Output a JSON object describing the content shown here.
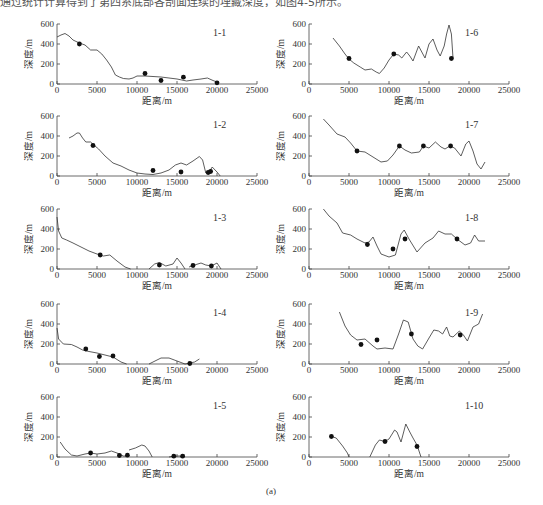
{
  "header": {
    "clipped_text": "通过统计计算得到了第四系底部各剖面连续的埋藏深度，如图4-5所示。"
  },
  "caption": "(a)",
  "axes": {
    "xlabel": "距离/m",
    "ylabel": "深度/m",
    "xticks": [
      0,
      5000,
      10000,
      15000,
      20000,
      25000
    ],
    "yticks": [
      0,
      200,
      400,
      600
    ],
    "xlim": [
      0,
      25000
    ],
    "ylim": [
      0,
      600
    ]
  },
  "chart_data": [
    {
      "type": "line",
      "title": "1-1",
      "line": [
        [
          0,
          470
        ],
        [
          500,
          490
        ],
        [
          1000,
          505
        ],
        [
          1500,
          480
        ],
        [
          2000,
          440
        ],
        [
          2800,
          410
        ],
        [
          3500,
          390
        ],
        [
          4200,
          340
        ],
        [
          5000,
          340
        ],
        [
          5600,
          300
        ],
        [
          6200,
          240
        ],
        [
          6800,
          170
        ],
        [
          7300,
          90
        ],
        [
          7800,
          70
        ],
        [
          8300,
          55
        ],
        [
          9000,
          50
        ],
        [
          9500,
          60
        ],
        [
          10000,
          80
        ],
        [
          11000,
          80
        ],
        [
          12000,
          75
        ],
        [
          13000,
          70
        ],
        [
          14000,
          60
        ],
        [
          15000,
          50
        ],
        [
          15600,
          40
        ],
        [
          16200,
          30
        ],
        [
          17000,
          40
        ],
        [
          18000,
          50
        ],
        [
          18800,
          60
        ],
        [
          19500,
          35
        ],
        [
          20000,
          20
        ]
      ],
      "points": [
        [
          2800,
          400
        ],
        [
          11000,
          105
        ],
        [
          13000,
          35
        ],
        [
          15800,
          68
        ],
        [
          20000,
          12
        ]
      ],
      "xlim": [
        0,
        25000
      ],
      "ylim": [
        0,
        600
      ]
    },
    {
      "type": "line",
      "title": "1-2",
      "line": [
        [
          1500,
          380
        ],
        [
          2000,
          400
        ],
        [
          2500,
          430
        ],
        [
          2800,
          430
        ],
        [
          3200,
          380
        ],
        [
          3600,
          340
        ],
        [
          4200,
          340
        ],
        [
          4600,
          310
        ],
        [
          5200,
          270
        ],
        [
          6000,
          200
        ],
        [
          7000,
          130
        ],
        [
          8000,
          100
        ],
        [
          9000,
          60
        ],
        [
          10000,
          30
        ],
        [
          11000,
          20
        ],
        [
          12000,
          15
        ],
        [
          13000,
          30
        ],
        [
          14000,
          60
        ],
        [
          14800,
          110
        ],
        [
          15500,
          130
        ],
        [
          16200,
          110
        ],
        [
          17000,
          150
        ],
        [
          17800,
          195
        ],
        [
          18200,
          160
        ],
        [
          18600,
          30
        ],
        [
          18900,
          20
        ],
        [
          19400,
          90
        ],
        [
          20000,
          40
        ],
        [
          20400,
          0
        ]
      ],
      "points": [
        [
          4500,
          305
        ],
        [
          12000,
          55
        ],
        [
          15500,
          40
        ],
        [
          18900,
          35
        ],
        [
          19200,
          45
        ]
      ],
      "xlim": [
        0,
        25000
      ],
      "ylim": [
        0,
        600
      ]
    },
    {
      "type": "line",
      "title": "1-3",
      "line": [
        [
          0,
          520
        ],
        [
          200,
          380
        ],
        [
          600,
          310
        ],
        [
          1200,
          290
        ],
        [
          2000,
          260
        ],
        [
          3000,
          220
        ],
        [
          4000,
          180
        ],
        [
          5000,
          150
        ],
        [
          5800,
          130
        ],
        [
          6600,
          140
        ],
        [
          7500,
          80
        ],
        [
          8500,
          20
        ],
        [
          9200,
          0
        ]
      ],
      "line2": [
        [
          11500,
          0
        ],
        [
          12200,
          50
        ],
        [
          12800,
          65
        ],
        [
          13600,
          30
        ],
        [
          14500,
          50
        ],
        [
          15000,
          110
        ],
        [
          15500,
          60
        ],
        [
          16000,
          0
        ]
      ],
      "line3": [
        [
          16500,
          20
        ],
        [
          17200,
          40
        ],
        [
          18000,
          60
        ],
        [
          18600,
          40
        ],
        [
          19300,
          30
        ],
        [
          20000,
          60
        ],
        [
          20500,
          0
        ]
      ],
      "points": [
        [
          5400,
          140
        ],
        [
          12800,
          40
        ],
        [
          17000,
          35
        ],
        [
          19300,
          30
        ]
      ],
      "xlim": [
        0,
        25000
      ],
      "ylim": [
        0,
        600
      ]
    },
    {
      "type": "line",
      "title": "1-4",
      "line": [
        [
          0,
          360
        ],
        [
          200,
          250
        ],
        [
          800,
          200
        ],
        [
          1800,
          195
        ],
        [
          2500,
          170
        ],
        [
          3200,
          140
        ],
        [
          4000,
          125
        ],
        [
          5000,
          110
        ],
        [
          6000,
          90
        ],
        [
          7000,
          70
        ],
        [
          8000,
          20
        ],
        [
          8700,
          0
        ]
      ],
      "line2": [
        [
          11500,
          0
        ],
        [
          12500,
          40
        ],
        [
          13000,
          60
        ],
        [
          14000,
          60
        ],
        [
          15000,
          30
        ],
        [
          16000,
          0
        ],
        [
          16600,
          10
        ],
        [
          17200,
          20
        ],
        [
          17800,
          50
        ]
      ],
      "points": [
        [
          3600,
          150
        ],
        [
          5300,
          75
        ],
        [
          7000,
          80
        ],
        [
          16600,
          5
        ]
      ],
      "xlim": [
        0,
        25000
      ],
      "ylim": [
        0,
        600
      ]
    },
    {
      "type": "line",
      "title": "1-5",
      "line": [
        [
          400,
          150
        ],
        [
          1000,
          80
        ],
        [
          1800,
          20
        ],
        [
          2500,
          10
        ],
        [
          3500,
          30
        ],
        [
          4200,
          40
        ],
        [
          5000,
          30
        ],
        [
          6000,
          40
        ],
        [
          6800,
          60
        ],
        [
          7500,
          40
        ],
        [
          8300,
          10
        ],
        [
          9000,
          10
        ]
      ],
      "line2": [
        [
          9000,
          70
        ],
        [
          9800,
          90
        ],
        [
          10600,
          120
        ],
        [
          11000,
          110
        ],
        [
          11500,
          60
        ],
        [
          11900,
          0
        ]
      ],
      "line3": [
        [
          14000,
          0
        ],
        [
          14600,
          10
        ],
        [
          15500,
          10
        ],
        [
          16000,
          20
        ]
      ],
      "points": [
        [
          4200,
          40
        ],
        [
          7800,
          15
        ],
        [
          8800,
          18
        ],
        [
          14600,
          8
        ],
        [
          15700,
          8
        ]
      ],
      "xlim": [
        0,
        25000
      ],
      "ylim": [
        0,
        600
      ]
    },
    {
      "type": "line",
      "title": "1-6",
      "line": [
        [
          3000,
          460
        ],
        [
          3800,
          380
        ],
        [
          4500,
          300
        ],
        [
          5000,
          250
        ],
        [
          5600,
          210
        ],
        [
          6400,
          170
        ],
        [
          7000,
          140
        ],
        [
          7800,
          150
        ],
        [
          8400,
          120
        ],
        [
          8800,
          105
        ],
        [
          9400,
          160
        ],
        [
          10000,
          240
        ],
        [
          10600,
          300
        ],
        [
          11200,
          290
        ],
        [
          11600,
          260
        ],
        [
          12200,
          320
        ],
        [
          12600,
          280
        ],
        [
          13000,
          230
        ],
        [
          13700,
          380
        ],
        [
          14100,
          320
        ],
        [
          14500,
          260
        ],
        [
          15000,
          400
        ],
        [
          15500,
          450
        ],
        [
          16000,
          340
        ],
        [
          16400,
          280
        ],
        [
          16900,
          380
        ],
        [
          17200,
          500
        ],
        [
          17500,
          590
        ],
        [
          17800,
          500
        ],
        [
          18000,
          260
        ]
      ],
      "points": [
        [
          5000,
          255
        ],
        [
          10600,
          300
        ],
        [
          17800,
          255
        ]
      ],
      "xlim": [
        0,
        25000
      ],
      "ylim": [
        0,
        600
      ]
    },
    {
      "type": "line",
      "title": "1-7",
      "line": [
        [
          1800,
          570
        ],
        [
          2500,
          510
        ],
        [
          3500,
          420
        ],
        [
          4500,
          390
        ],
        [
          5200,
          330
        ],
        [
          6000,
          250
        ],
        [
          7000,
          240
        ],
        [
          8000,
          190
        ],
        [
          9000,
          140
        ],
        [
          9800,
          150
        ],
        [
          10500,
          210
        ],
        [
          11300,
          300
        ],
        [
          12000,
          260
        ],
        [
          12800,
          230
        ],
        [
          13800,
          240
        ],
        [
          14300,
          300
        ],
        [
          15000,
          280
        ],
        [
          15800,
          340
        ],
        [
          16500,
          290
        ],
        [
          17000,
          270
        ],
        [
          17600,
          300
        ],
        [
          18200,
          280
        ],
        [
          19000,
          200
        ],
        [
          19600,
          320
        ],
        [
          20000,
          350
        ],
        [
          20500,
          250
        ],
        [
          21000,
          120
        ],
        [
          21500,
          70
        ],
        [
          22000,
          140
        ]
      ],
      "points": [
        [
          6000,
          250
        ],
        [
          11300,
          300
        ],
        [
          14300,
          300
        ],
        [
          17700,
          300
        ]
      ],
      "xlim": [
        0,
        25000
      ],
      "ylim": [
        0,
        600
      ]
    },
    {
      "type": "line",
      "title": "1-8",
      "line": [
        [
          1800,
          600
        ],
        [
          2500,
          530
        ],
        [
          3500,
          460
        ],
        [
          4200,
          360
        ],
        [
          5200,
          340
        ],
        [
          6000,
          300
        ],
        [
          7000,
          260
        ],
        [
          7500,
          270
        ],
        [
          8000,
          320
        ],
        [
          8500,
          230
        ],
        [
          9000,
          150
        ],
        [
          10000,
          120
        ],
        [
          10800,
          140
        ],
        [
          11500,
          350
        ],
        [
          11900,
          390
        ],
        [
          12500,
          300
        ],
        [
          13500,
          170
        ],
        [
          14500,
          260
        ],
        [
          15500,
          310
        ],
        [
          16200,
          380
        ],
        [
          17000,
          350
        ],
        [
          17800,
          350
        ],
        [
          18500,
          300
        ],
        [
          19500,
          240
        ],
        [
          20200,
          260
        ],
        [
          20700,
          340
        ],
        [
          21200,
          280
        ],
        [
          22000,
          280
        ]
      ],
      "points": [
        [
          7300,
          245
        ],
        [
          10500,
          200
        ],
        [
          12000,
          300
        ],
        [
          18500,
          300
        ]
      ],
      "xlim": [
        0,
        25000
      ],
      "ylim": [
        0,
        600
      ]
    },
    {
      "type": "line",
      "title": "1-9",
      "line": [
        [
          3800,
          520
        ],
        [
          4500,
          380
        ],
        [
          5200,
          290
        ],
        [
          6000,
          240
        ],
        [
          7000,
          250
        ],
        [
          8000,
          180
        ],
        [
          8500,
          150
        ],
        [
          9500,
          160
        ],
        [
          10500,
          150
        ],
        [
          11200,
          300
        ],
        [
          11800,
          440
        ],
        [
          12400,
          420
        ],
        [
          13000,
          250
        ],
        [
          13600,
          180
        ],
        [
          14200,
          150
        ],
        [
          15000,
          260
        ],
        [
          15600,
          340
        ],
        [
          16200,
          330
        ],
        [
          16700,
          300
        ],
        [
          17200,
          370
        ],
        [
          17600,
          280
        ],
        [
          18000,
          270
        ],
        [
          18800,
          330
        ],
        [
          19300,
          290
        ],
        [
          19800,
          230
        ],
        [
          20500,
          370
        ],
        [
          21200,
          400
        ],
        [
          21700,
          500
        ]
      ],
      "points": [
        [
          6500,
          195
        ],
        [
          8500,
          240
        ],
        [
          12800,
          300
        ],
        [
          18900,
          290
        ]
      ],
      "xlim": [
        0,
        25000
      ],
      "ylim": [
        0,
        600
      ]
    },
    {
      "type": "line",
      "title": "1-10",
      "line": [
        [
          2800,
          205
        ],
        [
          3400,
          190
        ],
        [
          4200,
          110
        ],
        [
          4800,
          40
        ],
        [
          5000,
          0
        ]
      ],
      "line2": [
        [
          7600,
          0
        ],
        [
          8300,
          120
        ],
        [
          8800,
          170
        ],
        [
          9500,
          155
        ],
        [
          10000,
          180
        ],
        [
          10700,
          270
        ],
        [
          11000,
          250
        ],
        [
          11500,
          150
        ],
        [
          12100,
          330
        ],
        [
          12600,
          250
        ],
        [
          13000,
          190
        ],
        [
          13500,
          120
        ],
        [
          14000,
          0
        ]
      ],
      "points": [
        [
          2800,
          205
        ],
        [
          9500,
          155
        ],
        [
          13500,
          105
        ]
      ],
      "xlim": [
        0,
        25000
      ],
      "ylim": [
        0,
        600
      ]
    }
  ]
}
